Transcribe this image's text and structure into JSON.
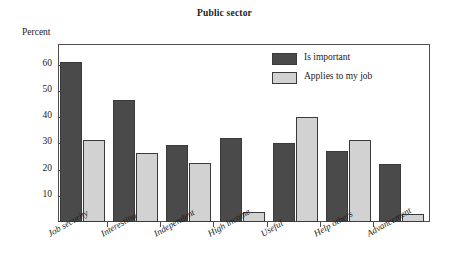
{
  "chart_data": {
    "type": "bar",
    "title": "Public sector",
    "xlabel": "",
    "ylabel": "Percent",
    "ylim": [
      0,
      68
    ],
    "yticks": [
      10,
      20,
      30,
      40,
      50,
      60
    ],
    "grid": false,
    "legend_position": "top-right-inside",
    "categories": [
      "Job security",
      "Interesting",
      "Independent",
      "High income",
      "Useful",
      "Help others",
      "Advancement"
    ],
    "series": [
      {
        "name": "Is important",
        "color": "#4a4a4a",
        "values": [
          61,
          46.5,
          29.5,
          32,
          30,
          27,
          22
        ]
      },
      {
        "name": "Applies to my job",
        "color": "#d2d2d2",
        "values": [
          31.5,
          26.5,
          22.5,
          4,
          40,
          31.5,
          3
        ]
      }
    ]
  },
  "axis": {
    "y_caption": "Percent",
    "y_tick_labels": [
      "10",
      "20",
      "30",
      "40",
      "50",
      "60"
    ]
  },
  "legend": {
    "items": [
      {
        "label": "Is important",
        "swatch": "dark"
      },
      {
        "label": "Applies to my job",
        "swatch": "light"
      }
    ]
  }
}
